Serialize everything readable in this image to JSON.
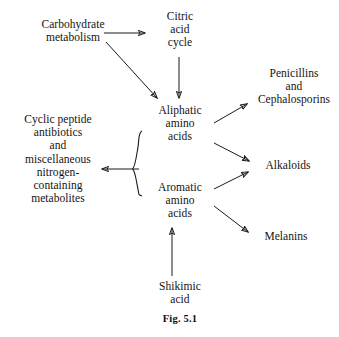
{
  "figure": {
    "caption": "Fig. 5.1",
    "background_color": "#ffffff",
    "ink_color": "#141414",
    "top_clipped_text": "metabolism of amino acids"
  },
  "nodes": {
    "carbohydrate_metabolism": {
      "label": "Carbohydrate\nmetabolism",
      "x": 23,
      "y": 18,
      "width": 100
    },
    "citric_acid_cycle": {
      "label": "Citric\nacid\ncycle",
      "x": 152,
      "y": 10,
      "width": 56
    },
    "aliphatic_amino_acids": {
      "label": "Aliphatic\namino\nacids",
      "x": 148,
      "y": 104,
      "width": 64
    },
    "aromatic_amino_acids": {
      "label": "Aromatic\namino\nacids",
      "x": 148,
      "y": 181,
      "width": 64
    },
    "shikimic_acid": {
      "label": "Shikimic\nacid",
      "x": 148,
      "y": 280,
      "width": 64
    },
    "cyclic_peptide_antibiotics": {
      "label": "Cyclic peptide\nantibiotics\nand\nmiscellaneous\nnitrogen-\ncontaining\nmetabolites",
      "x": 6,
      "y": 113,
      "width": 104
    },
    "penicillins_cephalosporins": {
      "label": "Penicillins\nand\nCephalosporins",
      "x": 250,
      "y": 67,
      "width": 88
    },
    "alkaloids": {
      "label": "Alkaloids",
      "x": 255,
      "y": 159,
      "width": 66
    },
    "melanins": {
      "label": "Melanins",
      "x": 253,
      "y": 230,
      "width": 66
    }
  },
  "edges": [
    {
      "name": "carbohydrate-to-citric",
      "from": "carbohydrate_metabolism",
      "to": "citric_acid_cycle",
      "x1": 104,
      "y1": 33,
      "x2": 146,
      "y2": 33,
      "arrow": "end"
    },
    {
      "name": "carbohydrate-to-aliphatic",
      "from": "carbohydrate_metabolism",
      "to": "aliphatic_amino_acids",
      "x1": 106,
      "y1": 42,
      "x2": 158,
      "y2": 99,
      "arrow": "end"
    },
    {
      "name": "citric-to-aliphatic",
      "from": "citric_acid_cycle",
      "to": "aliphatic_amino_acids",
      "x1": 179,
      "y1": 57,
      "x2": 179,
      "y2": 99,
      "arrow": "end"
    },
    {
      "name": "aliphatic-to-penicillins",
      "from": "aliphatic_amino_acids",
      "to": "penicillins_cephalosporins",
      "x1": 214,
      "y1": 122,
      "x2": 248,
      "y2": 103,
      "arrow": "end"
    },
    {
      "name": "aliphatic-to-alkaloids",
      "from": "aliphatic_amino_acids",
      "to": "alkaloids",
      "x1": 214,
      "y1": 143,
      "x2": 250,
      "y2": 161,
      "arrow": "end"
    },
    {
      "name": "aromatic-to-alkaloids",
      "from": "aromatic_amino_acids",
      "to": "alkaloids",
      "x1": 214,
      "y1": 188,
      "x2": 249,
      "y2": 172,
      "arrow": "end"
    },
    {
      "name": "aromatic-to-melanins",
      "from": "aromatic_amino_acids",
      "to": "melanins",
      "x1": 214,
      "y1": 205,
      "x2": 249,
      "y2": 232,
      "arrow": "end"
    },
    {
      "name": "shikimic-to-aromatic",
      "from": "shikimic_acid",
      "to": "aromatic_amino_acids",
      "x1": 172,
      "y1": 276,
      "x2": 172,
      "y2": 227,
      "arrow": "end"
    },
    {
      "name": "brace-to-cyclic-peptides",
      "from": "brace_group",
      "to": "cyclic_peptide_antibiotics",
      "x1": 140,
      "y1": 169,
      "x2": 101,
      "y2": 169,
      "arrow": "end"
    }
  ],
  "brace": {
    "name": "amino-acid-group-brace",
    "x": 140,
    "y_top": 131,
    "y_bottom": 196,
    "description": "curly brace grouping aliphatic and aromatic amino acids"
  }
}
